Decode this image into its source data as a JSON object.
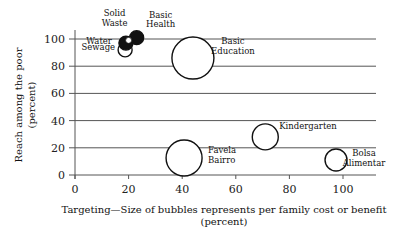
{
  "chart_data": {
    "type": "scatter",
    "subtype": "bubble",
    "title": "",
    "xlabel": "Targeting—Size of bubbles represents per family cost or benefit",
    "xlabel_unit": "(percent)",
    "ylabel": "Reach among the poor",
    "ylabel_unit": "(percent)",
    "xlim": [
      0,
      115
    ],
    "ylim": [
      0,
      110
    ],
    "x_ticks": [
      0,
      20,
      40,
      60,
      80,
      100
    ],
    "y_ticks": [
      0,
      20,
      40,
      60,
      80,
      100
    ],
    "grid": "horizontal",
    "legend": "none",
    "points": [
      {
        "label": "Basic Health",
        "x": 23,
        "y": 101,
        "size": 7,
        "filled": true,
        "label_lines": [
          "Basic",
          "Health"
        ]
      },
      {
        "label": "Water",
        "x": 19,
        "y": 97,
        "size": 7,
        "filled": true,
        "label_lines": [
          "Water"
        ]
      },
      {
        "label": "Solid Waste",
        "x": 20,
        "y": 99,
        "size": 3,
        "filled": false,
        "label_lines": [
          "Solid",
          "Waste"
        ]
      },
      {
        "label": "Sewage",
        "x": 18.7,
        "y": 92,
        "size": 7,
        "filled": false,
        "label_lines": [
          "Sewage"
        ]
      },
      {
        "label": "Basic Education",
        "x": 44,
        "y": 86,
        "size": 21,
        "filled": false,
        "label_lines": [
          "Basic",
          "Education"
        ]
      },
      {
        "label": "Kindergarten",
        "x": 71,
        "y": 28,
        "size": 13,
        "filled": false,
        "label_lines": [
          "Kindergarten"
        ]
      },
      {
        "label": "Favela Bairro",
        "x": 40.7,
        "y": 12.5,
        "size": 18,
        "filled": false,
        "label_lines": [
          "Favela",
          "Bairro"
        ]
      },
      {
        "label": "Bolsa Alimentar",
        "x": 97.4,
        "y": 11,
        "size": 11,
        "filled": false,
        "label_lines": [
          "Bolsa",
          "Alimentar"
        ]
      }
    ]
  },
  "colors": {
    "grid": "#555555",
    "bubble_stroke": "#111111",
    "bubble_fill": "#ffffff",
    "bubble_filled": "#111111"
  }
}
